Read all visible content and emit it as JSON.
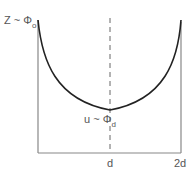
{
  "diagram": {
    "top_label": {
      "main": "Z ~ Φ",
      "sub": "o"
    },
    "min_label": {
      "main": "u ~ Φ",
      "sub": "d"
    },
    "x_ticks": [
      "d",
      "2d"
    ],
    "colors": {
      "curve": "#222222",
      "axes": "#888888",
      "dashed": "#666666",
      "text": "#555555"
    }
  }
}
